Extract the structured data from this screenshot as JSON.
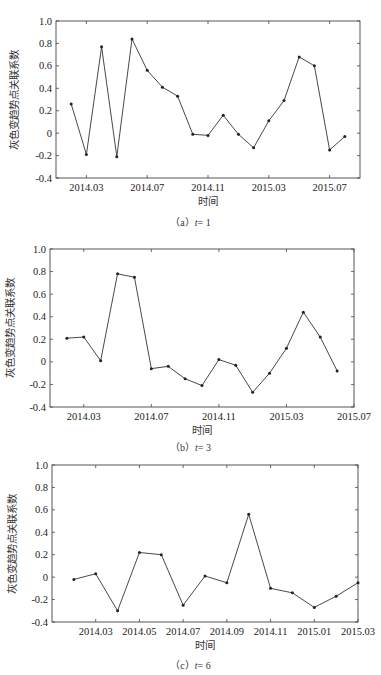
{
  "chart_data": [
    {
      "type": "line",
      "title": "",
      "caption_prefix": "（a）",
      "caption_var": "t",
      "caption_value": "= 1",
      "xlabel": "时间",
      "ylabel": "灰色变趋势点关联系数",
      "ylim": [
        -0.4,
        1.0
      ],
      "yticks": [
        "-0.4",
        "-0.2",
        "0",
        "0.2",
        "0.4",
        "0.6",
        "0.8",
        "1.0"
      ],
      "xtick_labels": [
        "2014.03",
        "2014.07",
        "2014.11",
        "2015.03",
        "2015.07"
      ],
      "xtick_index": [
        1,
        5,
        9,
        13,
        17
      ],
      "xrange_index": [
        -1,
        19
      ],
      "grid": false,
      "series": [
        {
          "name": "t=1",
          "x": [
            "2014.02",
            "2014.03",
            "2014.04",
            "2014.05",
            "2014.06",
            "2014.07",
            "2014.08",
            "2014.09",
            "2014.10",
            "2014.11",
            "2014.12",
            "2015.01",
            "2015.02",
            "2015.03",
            "2015.04",
            "2015.05",
            "2015.06",
            "2015.07",
            "2015.08"
          ],
          "values": [
            0.26,
            -0.19,
            0.77,
            -0.21,
            0.84,
            0.56,
            0.41,
            0.33,
            -0.01,
            -0.02,
            0.16,
            -0.01,
            -0.13,
            0.11,
            0.29,
            0.68,
            0.6,
            -0.15,
            -0.03
          ]
        }
      ]
    },
    {
      "type": "line",
      "title": "",
      "caption_prefix": "（b）",
      "caption_var": "t",
      "caption_value": "= 3",
      "xlabel": "时间",
      "ylabel": "灰色变趋势点关联系数",
      "ylim": [
        -0.4,
        1.0
      ],
      "yticks": [
        "-0.4",
        "-0.2",
        "0",
        "0.2",
        "0.4",
        "0.6",
        "0.8",
        "1.0"
      ],
      "xtick_labels": [
        "2014.03",
        "2014.07",
        "2014.11",
        "2015.03",
        "2015.07"
      ],
      "xtick_index": [
        1,
        5,
        9,
        13,
        17
      ],
      "xrange_index": [
        -1,
        17
      ],
      "grid": false,
      "series": [
        {
          "name": "t=3",
          "x": [
            "2014.02",
            "2014.03",
            "2014.04",
            "2014.05",
            "2014.06",
            "2014.07",
            "2014.08",
            "2014.09",
            "2014.10",
            "2014.11",
            "2014.12",
            "2015.01",
            "2015.02",
            "2015.03",
            "2015.04",
            "2015.05",
            "2015.06"
          ],
          "values": [
            0.21,
            0.22,
            0.01,
            0.78,
            0.75,
            -0.06,
            -0.04,
            -0.15,
            -0.21,
            0.02,
            -0.03,
            -0.27,
            -0.1,
            0.12,
            0.44,
            0.22,
            -0.08
          ]
        }
      ]
    },
    {
      "type": "line",
      "title": "",
      "caption_prefix": "（c）",
      "caption_var": "t",
      "caption_value": "= 6",
      "xlabel": "时间",
      "ylabel": "灰色变趋势点关联系数",
      "ylim": [
        -0.4,
        1.0
      ],
      "yticks": [
        "-0.4",
        "-0.2",
        "0",
        "0.2",
        "0.4",
        "0.6",
        "0.8",
        "1.0"
      ],
      "xtick_labels": [
        "2014.03",
        "2014.05",
        "2014.07",
        "2014.09",
        "2014.11",
        "2015.01",
        "2015.03"
      ],
      "xtick_index": [
        1,
        3,
        5,
        7,
        9,
        11,
        13
      ],
      "xrange_index": [
        -1,
        13
      ],
      "grid": false,
      "series": [
        {
          "name": "t=6",
          "x": [
            "2014.02",
            "2014.03",
            "2014.04",
            "2014.05",
            "2014.06",
            "2014.07",
            "2014.08",
            "2014.09",
            "2014.10",
            "2014.11",
            "2014.12",
            "2015.01",
            "2015.02",
            "2015.03"
          ],
          "values": [
            -0.02,
            0.03,
            -0.3,
            0.22,
            0.2,
            -0.25,
            0.01,
            -0.05,
            0.56,
            -0.1,
            -0.14,
            -0.27,
            -0.17,
            -0.05
          ]
        }
      ]
    }
  ]
}
